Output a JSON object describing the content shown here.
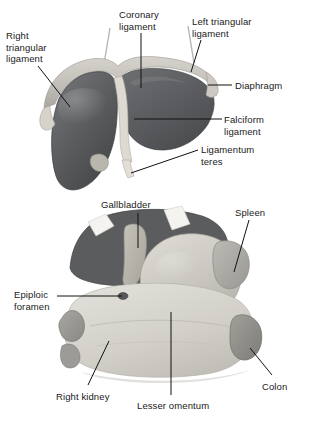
{
  "figure": {
    "background_color": "#ffffff",
    "text_color": "#1a1a1a",
    "leader_color": "#111111"
  },
  "palette": {
    "liver_dark": "#585a5c",
    "liver_dark_shadow": "#46484a",
    "liver_mid": "#6e7072",
    "diaphragm_light": "#c9c7c2",
    "diaphragm_edge": "#a8a6a2",
    "ligament_pale": "#ded9d1",
    "stomach_light": "#cfcdc6",
    "omentum_pale": "#d9d7d0",
    "kidney_gray": "#9b9995",
    "spleen_gray": "#b0aeaa",
    "colon_gray": "#8e8c88",
    "gallbladder": "#b8b5ad",
    "white_band": "#f2f1ee"
  },
  "panels": [
    {
      "id": "upper-panel",
      "name": "liver-anterior-view",
      "labels": [
        {
          "id": "right-triangular-ligament",
          "text": "Right\ntriangular\nligament",
          "lines": [
            "Right",
            "triangular",
            "ligament"
          ],
          "x": 6,
          "y": 30,
          "align": "left"
        },
        {
          "id": "coronary-ligament",
          "text": "Coronary\nligament",
          "lines": [
            "Coronary",
            "ligament"
          ],
          "x": 119,
          "y": 9,
          "align": "left"
        },
        {
          "id": "left-triangular-ligament",
          "text": "Left triangular\nligament",
          "lines": [
            "Left triangular",
            "ligament"
          ],
          "x": 192,
          "y": 16,
          "align": "left"
        },
        {
          "id": "diaphragm",
          "text": "Diaphragm",
          "lines": [
            "Diaphragm"
          ],
          "x": 235,
          "y": 80,
          "align": "left"
        },
        {
          "id": "falciform-ligament",
          "text": "Falciform\nligament",
          "lines": [
            "Falciform",
            "ligament"
          ],
          "x": 224,
          "y": 114,
          "align": "left"
        },
        {
          "id": "ligamentum-teres",
          "text": "Ligamentum\nteres",
          "lines": [
            "Ligamentum",
            "teres"
          ],
          "x": 201,
          "y": 144,
          "align": "left"
        }
      ]
    },
    {
      "id": "lower-panel",
      "name": "abdominal-viscera-view",
      "labels": [
        {
          "id": "gallbladder",
          "text": "Gallbladder",
          "lines": [
            "Gallbladder"
          ],
          "x": 101,
          "y": 199,
          "align": "left"
        },
        {
          "id": "spleen",
          "text": "Spleen",
          "lines": [
            "Spleen"
          ],
          "x": 235,
          "y": 207,
          "align": "left"
        },
        {
          "id": "epiploic-foramen",
          "text": "Epiploic\nforamen",
          "lines": [
            "Epiploic",
            "foramen"
          ],
          "x": 14,
          "y": 289,
          "align": "left"
        },
        {
          "id": "right-kidney",
          "text": "Right kidney",
          "lines": [
            "Right kidney"
          ],
          "x": 56,
          "y": 391,
          "align": "left"
        },
        {
          "id": "lesser-omentum",
          "text": "Lesser omentum",
          "lines": [
            "Lesser omentum"
          ],
          "x": 137,
          "y": 400,
          "align": "left"
        },
        {
          "id": "colon",
          "text": "Colon",
          "lines": [
            "Colon"
          ],
          "x": 262,
          "y": 381,
          "align": "left"
        }
      ]
    }
  ],
  "structures": [
    {
      "id": "liver-right-lobe",
      "name": "right-lobe-of-liver",
      "panel": "upper"
    },
    {
      "id": "liver-left-lobe",
      "name": "left-lobe-of-liver",
      "panel": "upper"
    },
    {
      "id": "diaphragm-band",
      "name": "diaphragm",
      "panel": "upper"
    },
    {
      "id": "falciform",
      "name": "falciform-ligament",
      "panel": "upper"
    },
    {
      "id": "teres",
      "name": "ligamentum-teres",
      "panel": "upper"
    },
    {
      "id": "gallbladder-body",
      "name": "gallbladder",
      "panel": "lower"
    },
    {
      "id": "stomach-body",
      "name": "stomach",
      "panel": "lower"
    },
    {
      "id": "spleen-body",
      "name": "spleen",
      "panel": "lower"
    },
    {
      "id": "kidney-body",
      "name": "right-kidney",
      "panel": "lower"
    },
    {
      "id": "colon-body",
      "name": "colon",
      "panel": "lower"
    },
    {
      "id": "omentum-body",
      "name": "lesser-omentum",
      "panel": "lower"
    }
  ]
}
